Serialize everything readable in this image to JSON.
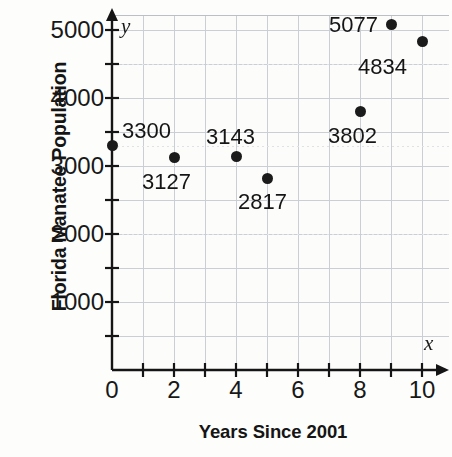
{
  "chart_data": {
    "type": "scatter",
    "title": "",
    "xlabel": "Years Since 2001",
    "ylabel": "Florida Manatee Population",
    "x_axis_variable": "x",
    "y_axis_variable": "y",
    "xlim": [
      0,
      10.85
    ],
    "ylim": [
      0,
      5220
    ],
    "grid": true,
    "grid_color": "#c9cfd4",
    "legend": "none",
    "point_color": "#1b1b1b",
    "x_tick_labels": [
      "0",
      "2",
      "4",
      "6",
      "8",
      "10"
    ],
    "x_tick_values": [
      0,
      2,
      4,
      6,
      8,
      10
    ],
    "x_minor_tick_values": [
      1,
      3,
      5,
      7,
      9
    ],
    "y_tick_labels": [
      "1000",
      "2000",
      "3000",
      "4000",
      "5000"
    ],
    "y_tick_values": [
      1000,
      2000,
      3000,
      4000,
      5000
    ],
    "y_minor_tick_values": [
      500,
      1500,
      2500,
      3500,
      4500
    ],
    "x": [
      0,
      2,
      4,
      5,
      8,
      9,
      10
    ],
    "y": [
      3300,
      3127,
      3143,
      2817,
      3802,
      5077,
      4834
    ],
    "points": [
      {
        "x": 0,
        "y": 3300,
        "label": "3300",
        "label_dx": 10,
        "label_dy": -26
      },
      {
        "x": 2,
        "y": 3127,
        "label": "3127",
        "label_dx": -32,
        "label_dy": 14
      },
      {
        "x": 4,
        "y": 3143,
        "label": "3143",
        "label_dx": -30,
        "label_dy": -30
      },
      {
        "x": 5,
        "y": 2817,
        "label": "2817",
        "label_dx": -29,
        "label_dy": 13
      },
      {
        "x": 8,
        "y": 3802,
        "label": "3802",
        "label_dx": -32,
        "label_dy": 14
      },
      {
        "x": 9,
        "y": 5077,
        "label": "5077",
        "label_dx": -62,
        "label_dy": -11
      },
      {
        "x": 10,
        "y": 4834,
        "label": "4834",
        "label_dx": -64,
        "label_dy": 15
      }
    ]
  }
}
